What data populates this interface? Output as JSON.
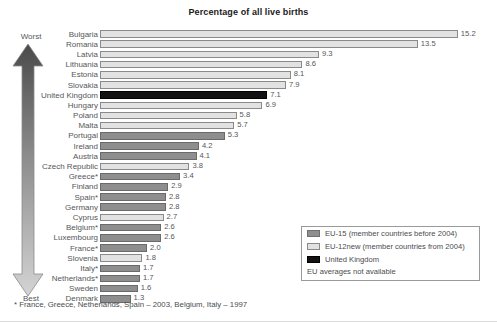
{
  "title": "Percentage of all live births",
  "axis_labels": {
    "worst": "Worst",
    "best": "Best"
  },
  "footnote": "* France, Greece, Netherlands, Spain – 2003, Belgium, Italy – 1997",
  "legend": {
    "items": [
      {
        "label": "EU-15 (member countries before 2004)",
        "key": "eu15",
        "color": "#8e8e8e"
      },
      {
        "label": "EU-12new (member countries from 2004)",
        "key": "eu12",
        "color": "#e2e2e2"
      },
      {
        "label": "United Kingdom",
        "key": "uk",
        "color": "#121212"
      }
    ],
    "note": "EU averages not available"
  },
  "colors": {
    "eu15": "#8e8e8e",
    "eu12new": "#e2e2e2",
    "uk": "#121212",
    "arrow_top": "#4a4a4a",
    "arrow_bottom": "#d2d2d2"
  },
  "chart_data": {
    "type": "bar",
    "orientation": "horizontal",
    "title": "Percentage of all live births",
    "xlabel": "Percentage of all live births",
    "ylabel": "",
    "xlim": [
      0,
      15.8
    ],
    "grid": false,
    "legend_position": "bottom-right",
    "categories": [
      "Bulgaria",
      "Romania",
      "Latvia",
      "Lithuania",
      "Estonia",
      "Slovakia",
      "United Kingdom",
      "Hungary",
      "Poland",
      "Malta",
      "Portugal",
      "Ireland",
      "Austria",
      "Czech Republic",
      "Greece*",
      "Finland",
      "Spain*",
      "Germany",
      "Cyprus",
      "Belgium*",
      "Luxembourg",
      "France*",
      "Slovenia",
      "Italy*",
      "Netherlands*",
      "Sweden",
      "Denmark"
    ],
    "values": [
      15.2,
      13.5,
      9.3,
      8.6,
      8.1,
      7.9,
      7.1,
      6.9,
      5.8,
      5.7,
      5.3,
      4.2,
      4.1,
      3.8,
      3.4,
      2.9,
      2.8,
      2.8,
      2.7,
      2.6,
      2.6,
      2.0,
      1.8,
      1.7,
      1.7,
      1.6,
      1.3
    ],
    "value_labels": [
      "15.2",
      "13.5",
      "9.3",
      "8.6",
      "8.1",
      "7.9",
      "7.1",
      "6.9",
      "5.8",
      "5.7",
      "5.3",
      "4.2",
      "4.1",
      "3.8",
      "3.4",
      "2.9",
      "2.8",
      "2.8",
      "2.7",
      "2.6",
      "2.6",
      "2.0",
      "1.8",
      "1.7",
      "1.7",
      "1.6",
      "1.3"
    ],
    "groups": [
      "eu12",
      "eu12",
      "eu12",
      "eu12",
      "eu12",
      "eu12",
      "uk",
      "eu12",
      "eu12",
      "eu12",
      "eu15",
      "eu15",
      "eu15",
      "eu12",
      "eu15",
      "eu15",
      "eu15",
      "eu15",
      "eu12",
      "eu15",
      "eu15",
      "eu15",
      "eu12",
      "eu15",
      "eu15",
      "eu15",
      "eu15"
    ]
  }
}
